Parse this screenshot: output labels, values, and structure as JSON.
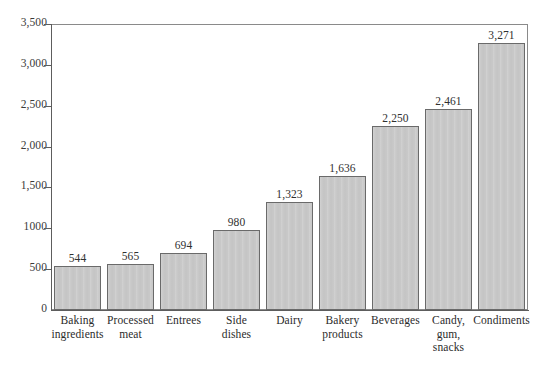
{
  "chart_data": {
    "type": "bar",
    "title": "",
    "subtitle": "",
    "xlabel": "",
    "ylabel": "",
    "ylim": [
      0,
      3500
    ],
    "grid": false,
    "legend": null,
    "orientation": "vertical",
    "categories": [
      "Baking ingredients",
      "Processed meat",
      "Entrees",
      "Side dishes",
      "Dairy",
      "Bakery products",
      "Beverages",
      "Candy, gum, snacks",
      "Condiments"
    ],
    "category_lines": [
      [
        "Baking",
        "ingredients"
      ],
      [
        "Processed",
        "meat"
      ],
      [
        "Entrees"
      ],
      [
        "Side",
        "dishes"
      ],
      [
        "Dairy"
      ],
      [
        "Bakery",
        "products"
      ],
      [
        "Beverages"
      ],
      [
        "Candy,",
        "gum,",
        "snacks"
      ],
      [
        "Condiments"
      ]
    ],
    "values": [
      544,
      565,
      694,
      980,
      1323,
      1636,
      2250,
      2461,
      3271
    ],
    "value_labels": [
      "544",
      "565",
      "694",
      "980",
      "1,323",
      "1,636",
      "2,250",
      "2,461",
      "3,271"
    ],
    "y_ticks": [
      0,
      500,
      1000,
      1500,
      2000,
      2500,
      3000,
      3500
    ],
    "y_tick_labels": [
      "0",
      "500",
      "1000",
      "1,500",
      "2,000",
      "2,500",
      "3,000",
      "3,500"
    ],
    "colors": {
      "bar_fill": "#c9c9c9",
      "bar_border": "#6a6a6a",
      "axis": "#5d5d5d",
      "frame": "#8a8a8a",
      "text": "#2b2b2b",
      "background": "#ffffff"
    }
  }
}
